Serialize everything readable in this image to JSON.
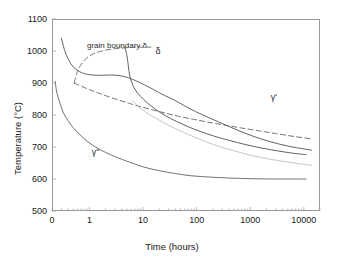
{
  "chart_data": {
    "type": "line",
    "title": "",
    "xlabel": "Time (hours)",
    "ylabel": "Temperature (°C)",
    "xscale": "log",
    "xlim": [
      0.2,
      20000
    ],
    "ylim": [
      500,
      1100
    ],
    "grid": false,
    "legend_position": "none",
    "x_ticks": [
      {
        "label": "0",
        "value": 0.2
      },
      {
        "label": "1",
        "value": 1
      },
      {
        "label": "10",
        "value": 10
      },
      {
        "label": "100",
        "value": 100
      },
      {
        "label": "1000",
        "value": 1000
      },
      {
        "label": "10000",
        "value": 10000
      }
    ],
    "y_ticks": [
      {
        "label": "500",
        "value": 500
      },
      {
        "label": "600",
        "value": 600
      },
      {
        "label": "700",
        "value": 700
      },
      {
        "label": "800",
        "value": 800
      },
      {
        "label": "900",
        "value": 900
      },
      {
        "label": "1000",
        "value": 1000
      },
      {
        "label": "1100",
        "value": 1100
      }
    ],
    "annotations": [
      {
        "name": "grain-boundary-delta",
        "text": "grain boundary δ",
        "x": 0.9,
        "y": 1015
      },
      {
        "name": "delta",
        "text": "δ",
        "x": 17,
        "y": 1000
      },
      {
        "name": "gamma-prime",
        "text": "γ'",
        "x": 2400,
        "y": 855
      },
      {
        "name": "gamma-double-prime",
        "text": "γ''",
        "x": 1.1,
        "y": 683
      }
    ],
    "series": [
      {
        "name": "delta solid C-curve",
        "style": "solid",
        "color": "#5a5a5a",
        "points": [
          [
            0.3,
            1040
          ],
          [
            0.34,
            1005
          ],
          [
            0.4,
            975
          ],
          [
            0.5,
            950
          ],
          [
            0.7,
            933
          ],
          [
            1.0,
            926
          ],
          [
            1.6,
            924
          ],
          [
            2.6,
            925
          ],
          [
            4.0,
            922
          ],
          [
            6.0,
            913
          ],
          [
            9.0,
            900
          ],
          [
            14,
            884
          ],
          [
            22,
            866
          ],
          [
            40,
            845
          ],
          [
            70,
            822
          ],
          [
            130,
            800
          ],
          [
            260,
            778
          ],
          [
            500,
            757
          ],
          [
            1000,
            737
          ],
          [
            2200,
            718
          ],
          [
            5000,
            703
          ],
          [
            10000,
            694
          ],
          [
            14000,
            690
          ]
        ]
      },
      {
        "name": "delta solid upper branch",
        "style": "solid",
        "color": "#5a5a5a",
        "points": [
          [
            4.6,
            1012
          ],
          [
            5.0,
            985
          ],
          [
            5.3,
            955
          ],
          [
            5.6,
            925
          ],
          [
            6.2,
            900
          ],
          [
            7.2,
            878
          ],
          [
            9.0,
            858
          ],
          [
            12,
            838
          ],
          [
            17,
            818
          ],
          [
            26,
            798
          ],
          [
            42,
            780
          ],
          [
            70,
            763
          ],
          [
            120,
            748
          ],
          [
            220,
            733
          ],
          [
            420,
            720
          ],
          [
            800,
            708
          ],
          [
            1600,
            697
          ],
          [
            3200,
            688
          ],
          [
            6000,
            681
          ],
          [
            11000,
            676
          ]
        ]
      },
      {
        "name": "grain boundary delta dashed",
        "style": "dashed",
        "color": "#6a6a6a",
        "points": [
          [
            0.52,
            900
          ],
          [
            0.58,
            930
          ],
          [
            0.68,
            955
          ],
          [
            0.85,
            975
          ],
          [
            1.15,
            990
          ],
          [
            1.7,
            1000
          ],
          [
            2.6,
            1006
          ],
          [
            4.0,
            1009
          ],
          [
            6.0,
            1011
          ],
          [
            9.0,
            1012
          ],
          [
            14,
            1012
          ]
        ]
      },
      {
        "name": "grain boundary delta dashed lower",
        "style": "dashed",
        "color": "#6a6a6a",
        "points": [
          [
            0.52,
            900
          ],
          [
            0.7,
            890
          ],
          [
            1.0,
            879
          ],
          [
            1.5,
            868
          ],
          [
            2.3,
            857
          ],
          [
            3.6,
            846
          ],
          [
            5.6,
            836
          ],
          [
            9.0,
            826
          ],
          [
            15,
            816
          ],
          [
            26,
            806
          ],
          [
            46,
            796
          ],
          [
            85,
            787
          ],
          [
            160,
            778
          ],
          [
            320,
            769
          ],
          [
            650,
            760
          ],
          [
            1400,
            751
          ],
          [
            3000,
            742
          ],
          [
            6500,
            733
          ],
          [
            13000,
            726
          ]
        ]
      },
      {
        "name": "gamma double prime solid C-curve",
        "style": "solid",
        "color": "#6a6a6a",
        "points": [
          [
            0.23,
            905
          ],
          [
            0.24,
            880
          ],
          [
            0.26,
            855
          ],
          [
            0.29,
            830
          ],
          [
            0.33,
            805
          ],
          [
            0.4,
            782
          ],
          [
            0.5,
            760
          ],
          [
            0.65,
            740
          ],
          [
            0.9,
            718
          ],
          [
            1.3,
            700
          ],
          [
            2.0,
            683
          ],
          [
            3.2,
            668
          ],
          [
            5.5,
            653
          ],
          [
            10,
            638
          ],
          [
            20,
            626
          ],
          [
            40,
            617
          ],
          [
            80,
            610
          ],
          [
            180,
            606
          ],
          [
            400,
            603
          ],
          [
            1000,
            601
          ],
          [
            2500,
            600
          ],
          [
            6000,
            600
          ],
          [
            11000,
            600
          ]
        ]
      },
      {
        "name": "gamma prime light curve",
        "style": "solid",
        "color": "#c2c2c2",
        "points": [
          [
            6.5,
            845
          ],
          [
            7.5,
            832
          ],
          [
            9.5,
            818
          ],
          [
            13,
            802
          ],
          [
            19,
            786
          ],
          [
            30,
            768
          ],
          [
            50,
            750
          ],
          [
            85,
            733
          ],
          [
            150,
            716
          ],
          [
            280,
            700
          ],
          [
            550,
            686
          ],
          [
            1100,
            673
          ],
          [
            2300,
            662
          ],
          [
            5000,
            653
          ],
          [
            10000,
            646
          ],
          [
            14000,
            643
          ]
        ]
      }
    ]
  }
}
